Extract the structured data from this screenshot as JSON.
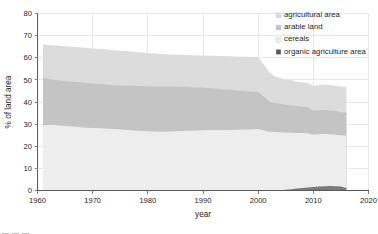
{
  "chart_data": {
    "type": "area",
    "title": "",
    "subtitle": "",
    "xlabel": "year",
    "ylabel": "% of land area",
    "xlim": [
      1960,
      2020
    ],
    "ylim": [
      0,
      80
    ],
    "xticks": [
      1960,
      1970,
      1980,
      1990,
      2000,
      2010,
      2020
    ],
    "yticks": [
      0,
      10,
      20,
      30,
      40,
      50,
      60,
      70,
      80
    ],
    "grid": true,
    "legend_position": "top-right",
    "stacked": false,
    "overlapping_areas": true,
    "x": [
      1961,
      1962,
      1963,
      1964,
      1965,
      1966,
      1967,
      1968,
      1969,
      1970,
      1971,
      1972,
      1973,
      1974,
      1975,
      1976,
      1977,
      1978,
      1979,
      1980,
      1981,
      1982,
      1983,
      1984,
      1985,
      1986,
      1987,
      1988,
      1989,
      1990,
      1991,
      1992,
      1993,
      1994,
      1995,
      1996,
      1997,
      1998,
      1999,
      2000,
      2001,
      2002,
      2003,
      2004,
      2005,
      2006,
      2007,
      2008,
      2009,
      2010,
      2011,
      2012,
      2013,
      2014,
      2015,
      2016
    ],
    "series": [
      {
        "name": "agricultural area",
        "color": "#dcdcdc",
        "values": [
          66.0,
          65.8,
          65.6,
          65.4,
          65.2,
          65.0,
          64.8,
          64.6,
          64.4,
          64.2,
          64.0,
          63.8,
          63.6,
          63.4,
          63.2,
          63.0,
          62.8,
          62.6,
          62.4,
          62.2,
          62.0,
          61.8,
          61.6,
          61.5,
          61.4,
          61.3,
          61.2,
          61.1,
          61.0,
          61.0,
          60.9,
          60.9,
          60.8,
          60.8,
          60.7,
          60.6,
          60.5,
          60.4,
          60.3,
          60.2,
          57.0,
          53.5,
          51.5,
          50.8,
          50.2,
          49.8,
          49.2,
          48.9,
          48.5,
          47.2,
          47.6,
          47.9,
          47.7,
          47.4,
          47.0,
          46.8
        ]
      },
      {
        "name": "arable land",
        "color": "#c4c4c4",
        "values": [
          51.0,
          50.5,
          50.0,
          49.7,
          49.4,
          49.2,
          49.0,
          48.8,
          48.6,
          48.4,
          48.2,
          48.0,
          47.8,
          47.6,
          47.5,
          47.4,
          47.3,
          47.2,
          47.2,
          47.1,
          47.0,
          47.0,
          47.0,
          47.0,
          47.0,
          46.9,
          46.8,
          46.7,
          46.6,
          46.5,
          46.3,
          46.1,
          45.9,
          45.7,
          45.5,
          45.3,
          45.1,
          44.9,
          44.7,
          44.5,
          42.5,
          40.2,
          39.6,
          39.2,
          38.8,
          38.4,
          38.2,
          37.9,
          37.6,
          36.0,
          36.4,
          36.4,
          36.2,
          35.9,
          35.4,
          35.1
        ]
      },
      {
        "name": "cereals",
        "color": "#ededed",
        "values": [
          29.5,
          29.6,
          29.7,
          29.4,
          29.2,
          29.0,
          28.8,
          28.6,
          28.4,
          28.3,
          28.2,
          28.0,
          27.9,
          27.8,
          27.6,
          27.4,
          27.2,
          27.0,
          26.9,
          26.8,
          26.7,
          26.6,
          26.6,
          26.7,
          26.8,
          26.9,
          27.0,
          27.0,
          27.1,
          27.2,
          27.3,
          27.3,
          27.3,
          27.4,
          27.4,
          27.5,
          27.6,
          27.6,
          27.7,
          27.8,
          27.2,
          26.6,
          26.4,
          26.3,
          26.2,
          26.1,
          26.0,
          26.0,
          25.9,
          25.2,
          25.4,
          25.5,
          25.4,
          25.2,
          25.0,
          24.8
        ]
      },
      {
        "name": "organic agriculture area",
        "color": "#7a7a7a",
        "values": [
          0,
          0,
          0,
          0,
          0,
          0,
          0,
          0,
          0,
          0,
          0,
          0,
          0,
          0,
          0,
          0,
          0,
          0,
          0,
          0,
          0,
          0,
          0,
          0,
          0,
          0,
          0,
          0,
          0,
          0,
          0,
          0,
          0,
          0,
          0,
          0,
          0,
          0,
          0,
          0,
          0,
          0,
          0,
          0.15,
          0.35,
          0.6,
          0.85,
          1.1,
          1.35,
          1.6,
          1.8,
          1.95,
          2.0,
          1.95,
          1.8,
          1.1
        ]
      }
    ]
  },
  "legend": {
    "items": [
      {
        "label": "agricultural area",
        "swatch": "#dcdcdc"
      },
      {
        "label": "arable land",
        "swatch": "#c4c4c4"
      },
      {
        "label": "cereals",
        "swatch": "#ededed"
      },
      {
        "label": "organic agriculture area",
        "swatch": "#595959"
      }
    ]
  },
  "axes": {
    "y_title": "% of land area",
    "x_title": "year",
    "y_tick_labels": [
      "0",
      "10",
      "20",
      "30",
      "40",
      "50",
      "60",
      "70",
      "80"
    ],
    "x_tick_labels": [
      "1960",
      "1970",
      "1980",
      "1990",
      "2000",
      "2010",
      "2020"
    ]
  }
}
